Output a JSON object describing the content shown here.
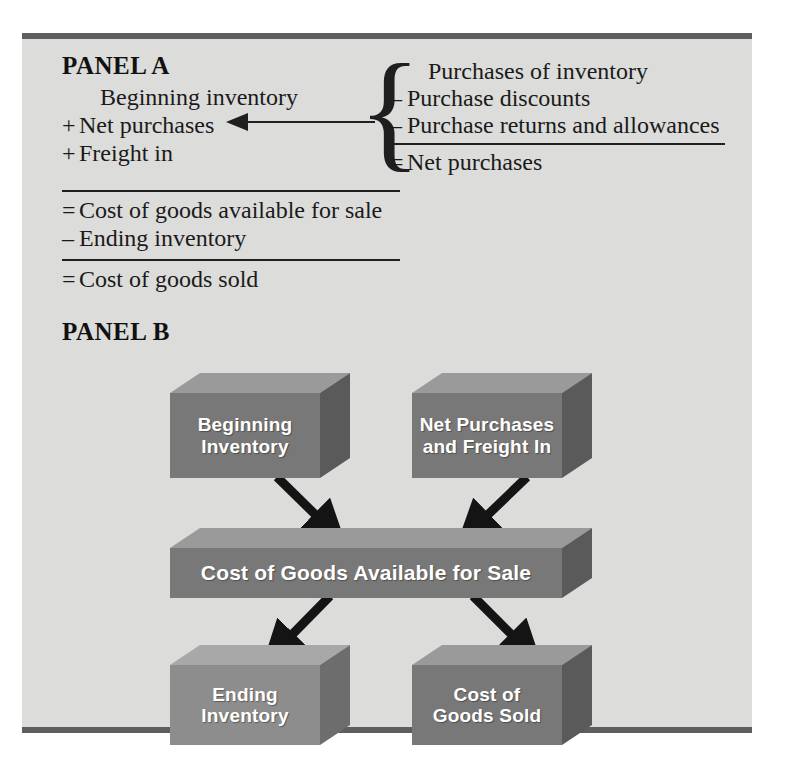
{
  "figure": {
    "panel_a": {
      "title": "PANEL A",
      "left_column": [
        {
          "op": "",
          "text": "Beginning inventory"
        },
        {
          "op": "+",
          "text": "Net purchases"
        },
        {
          "op": "+",
          "text": "Freight in"
        }
      ],
      "summary": [
        {
          "op": "=",
          "text": "Cost of goods available for sale"
        },
        {
          "op": "–",
          "text": "Ending inventory"
        }
      ],
      "result": {
        "op": "=",
        "text": "Cost of goods sold"
      },
      "brace_glyph": "{",
      "right_column": [
        {
          "op": "",
          "text": "Purchases of inventory"
        },
        {
          "op": "–",
          "text": "Purchase discounts"
        },
        {
          "op": "–",
          "text": "Purchase returns and allowances"
        }
      ],
      "right_result": {
        "op": "=",
        "text": "Net purchases"
      }
    },
    "panel_b": {
      "title": "PANEL B",
      "boxes": [
        {
          "id": "beginning-inventory",
          "line1": "Beginning",
          "line2": "Inventory"
        },
        {
          "id": "net-purchases-freight-in",
          "line1": "Net Purchases",
          "line2": "and Freight In"
        },
        {
          "id": "cost-of-goods-available",
          "line1": "Cost of Goods Available for Sale",
          "line2": ""
        },
        {
          "id": "ending-inventory",
          "line1": "Ending",
          "line2": "Inventory"
        },
        {
          "id": "cost-of-goods-sold",
          "line1": "Cost of",
          "line2": "Goods Sold"
        }
      ]
    },
    "colors": {
      "panel_background": "#dcdcda",
      "rule": "#5e5e5e",
      "box_front": "#787878",
      "box_top": "#9a9a9a",
      "box_side": "#5a5a5a",
      "box_front_light": "#8d8d8d",
      "arrow": "#141414",
      "text": "#1a1a1a",
      "box_text": "#ffffff"
    }
  }
}
